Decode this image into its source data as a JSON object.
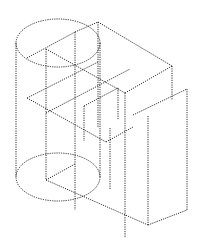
{
  "figure": {
    "line_color": "#1a1a1a",
    "background": "#ffffff",
    "line_style": "dotted",
    "ellipses": [
      {
        "name": "cylinder-top",
        "cx": 58,
        "cy": 43,
        "rx": 42,
        "ry": 24
      },
      {
        "name": "cylinder-bottom",
        "cx": 58,
        "cy": 177,
        "rx": 42,
        "ry": 24
      }
    ],
    "segments": [
      [
        16,
        43,
        16,
        177
      ],
      [
        100,
        43,
        100,
        177
      ],
      [
        27,
        58,
        75,
        32
      ],
      [
        46,
        49,
        46,
        180
      ],
      [
        46,
        49,
        125,
        93
      ],
      [
        75,
        32,
        98,
        22
      ],
      [
        98,
        22,
        172,
        66
      ],
      [
        75,
        32,
        75,
        136
      ],
      [
        98,
        22,
        98,
        128
      ],
      [
        27,
        98,
        98,
        62
      ],
      [
        27,
        98,
        106,
        142
      ],
      [
        46,
        113,
        130,
        69
      ],
      [
        84,
        106,
        118,
        88
      ],
      [
        84,
        106,
        84,
        141
      ],
      [
        118,
        88,
        118,
        120
      ],
      [
        125,
        93,
        172,
        66
      ],
      [
        125,
        93,
        125,
        240
      ],
      [
        172,
        66,
        172,
        100
      ],
      [
        133,
        115,
        187,
        89
      ],
      [
        187,
        89,
        187,
        210
      ],
      [
        106,
        142,
        133,
        127
      ],
      [
        148,
        116,
        148,
        225
      ],
      [
        46,
        180,
        148,
        225
      ],
      [
        148,
        225,
        187,
        210
      ],
      [
        46,
        180,
        75,
        164
      ],
      [
        75,
        136,
        75,
        210
      ],
      [
        110,
        128,
        110,
        190
      ]
    ]
  }
}
